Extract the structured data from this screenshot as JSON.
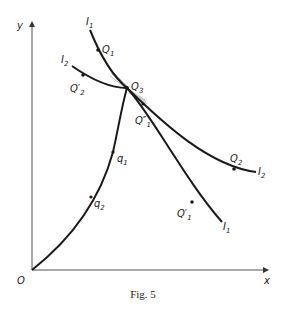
{
  "figure": {
    "caption": "Fig. 5",
    "axes": {
      "origin_label": "O",
      "x_label": "x",
      "y_label": "y"
    },
    "curves": {
      "I1": {
        "label": "I",
        "sub": "1"
      },
      "I2": {
        "label": "I",
        "sub": "2"
      },
      "path": {
        "description": "curve from O through q2, q1 to Q3"
      }
    },
    "points": {
      "Q1": {
        "label": "Q",
        "sub": "1"
      },
      "Q2": {
        "label": "Q",
        "sub": "2"
      },
      "Q3": {
        "label": "Q",
        "sub": "3"
      },
      "Q1_prime": {
        "label": "Q′",
        "sub": "1"
      },
      "Q1_dprime": {
        "label": "Q″",
        "sub": "1"
      },
      "Q2_prime": {
        "label": "Q′",
        "sub": "2"
      },
      "q1": {
        "label": "q",
        "sub": "1"
      },
      "q2": {
        "label": "q",
        "sub": "2"
      }
    },
    "colors": {
      "ink": "#1a1a1a",
      "axis": "#555555"
    }
  }
}
